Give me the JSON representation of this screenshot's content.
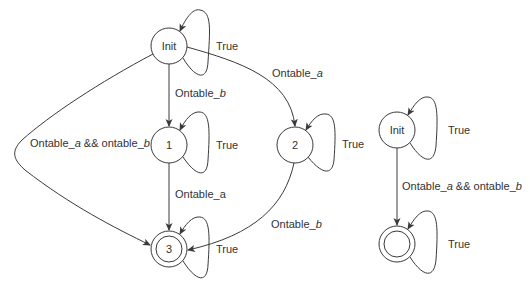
{
  "diagram": {
    "type": "state-machine",
    "left_automaton": {
      "nodes": [
        {
          "id": "init",
          "label": "Init",
          "accepting": false
        },
        {
          "id": "s1",
          "label": "1",
          "accepting": false
        },
        {
          "id": "s2",
          "label": "2",
          "accepting": false
        },
        {
          "id": "s3",
          "label": "3",
          "accepting": true
        }
      ],
      "edges": {
        "init_self": {
          "base": "True",
          "italic": ""
        },
        "init_to_1": {
          "base": "Ontable_",
          "italic": "b"
        },
        "init_to_2": {
          "base": "Ontable_",
          "italic": "a"
        },
        "init_to_3": {
          "base1": "Ontable_",
          "italic1": "a",
          "mid": " && ontable_",
          "italic2": "b"
        },
        "s1_self": {
          "base": "True"
        },
        "s1_to_3": {
          "base": "Ontable_a"
        },
        "s2_self": {
          "base": "True"
        },
        "s2_to_3": {
          "base": "Ontable_",
          "italic": "b"
        },
        "s3_self": {
          "base": "True"
        }
      }
    },
    "right_automaton": {
      "nodes": [
        {
          "id": "init",
          "label": "Init",
          "accepting": false
        },
        {
          "id": "final",
          "label": "",
          "accepting": true
        }
      ],
      "edges": {
        "init_self": {
          "base": "True"
        },
        "init_to_final": {
          "base1": "Ontable_",
          "italic1": "a",
          "mid": " && ontable_",
          "italic2": "b"
        },
        "final_self": {
          "base": "True"
        }
      }
    },
    "colors": {
      "stroke": "#3a3a3a",
      "text": "#333333",
      "background": "#ffffff"
    }
  }
}
